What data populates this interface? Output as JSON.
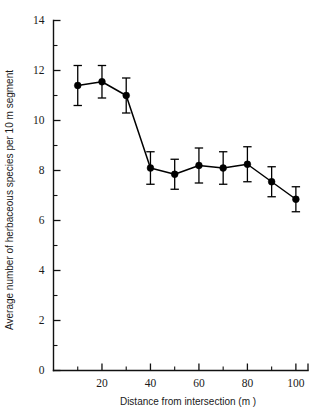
{
  "chart_data": {
    "type": "line",
    "title": "",
    "subtitle": "",
    "xlabel": "Distance from intersection (m )",
    "ylabel": "Average number of herbaceous species per 10 m segment",
    "xlim": [
      0,
      105
    ],
    "ylim": [
      0,
      14
    ],
    "grid": false,
    "legend": null,
    "legend_position": "none",
    "x_ticks_major": [
      20,
      40,
      60,
      80,
      100
    ],
    "x_ticks_minor": [
      10,
      30,
      50,
      70,
      90
    ],
    "x_tick_labels": [
      "20",
      "40",
      "60",
      "80",
      "100"
    ],
    "y_ticks_major": [
      0,
      2,
      4,
      6,
      8,
      10,
      12,
      14
    ],
    "y_ticks_minor": [
      1,
      3,
      5,
      7,
      9,
      11,
      13
    ],
    "y_tick_labels": [
      "0",
      "2",
      "4",
      "6",
      "8",
      "10",
      "12",
      "14"
    ],
    "marker": "filled-circle",
    "error_bars": "symmetric",
    "x": [
      10,
      20,
      30,
      40,
      50,
      60,
      70,
      80,
      90,
      100
    ],
    "values": [
      11.4,
      11.55,
      11.0,
      8.1,
      7.85,
      8.2,
      8.1,
      8.25,
      7.55,
      6.85
    ],
    "errors": [
      0.8,
      0.65,
      0.7,
      0.65,
      0.6,
      0.7,
      0.65,
      0.7,
      0.6,
      0.5
    ],
    "series": [
      {
        "name": "Average herbaceous species richness",
        "x": [
          10,
          20,
          30,
          40,
          50,
          60,
          70,
          80,
          90,
          100
        ],
        "values": [
          11.4,
          11.55,
          11.0,
          8.1,
          7.85,
          8.2,
          8.1,
          8.25,
          7.55,
          6.85
        ],
        "errors": [
          0.8,
          0.65,
          0.7,
          0.65,
          0.6,
          0.7,
          0.65,
          0.7,
          0.6,
          0.5
        ]
      }
    ],
    "colors": {
      "line": "#000000",
      "marker": "#000000",
      "axis": "#111111",
      "background": "#ffffff",
      "text": "#1a1a1a"
    }
  }
}
